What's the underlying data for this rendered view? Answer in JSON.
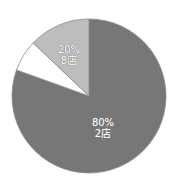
{
  "chart_data": {
    "type": "pie",
    "title": "",
    "start_angle_deg": 0,
    "direction": "clockwise_from_top",
    "slices": [
      {
        "name": "dark",
        "label_percent": "80%",
        "label_count": "2店",
        "value": 80.5,
        "color": "#777777",
        "labeled": true
      },
      {
        "name": "white",
        "label_percent": "",
        "label_count": "",
        "value": 6.6,
        "color": "#ffffff",
        "labeled": false
      },
      {
        "name": "light",
        "label_percent": "20%",
        "label_count": "8店",
        "value": 12.9,
        "color": "#bdbdbd",
        "labeled": true
      }
    ],
    "legend": null,
    "stroke_color": "#8a8a8a"
  },
  "labels": {
    "dark": {
      "percent": "80%",
      "count": "2店"
    },
    "light": {
      "percent": "20%",
      "count": "8店"
    }
  }
}
